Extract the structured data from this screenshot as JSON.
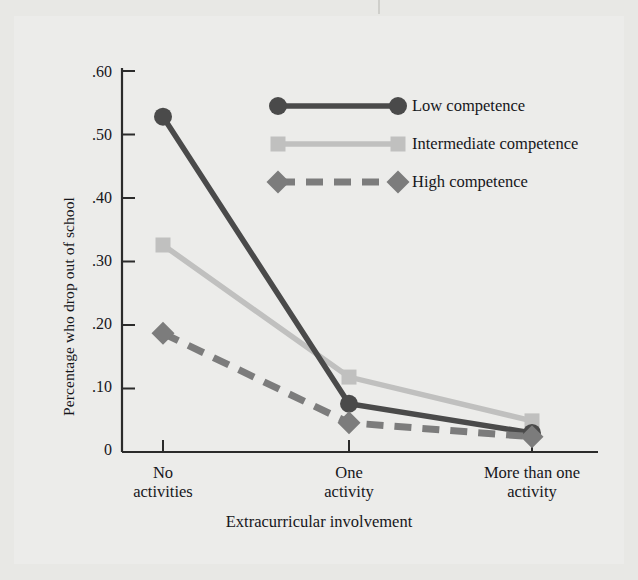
{
  "chart_data": {
    "type": "line",
    "title": "",
    "xlabel": "Extracurricular involvement",
    "ylabel": "Percentage who drop out of school",
    "categories": [
      "No\nactivities",
      "One\nactivity",
      "More than one\nactivity"
    ],
    "category_lines": [
      [
        "No",
        "activities"
      ],
      [
        "One",
        "activity"
      ],
      [
        "More than one",
        "activity"
      ]
    ],
    "ylim": [
      0,
      0.65
    ],
    "yticks": [
      0,
      0.1,
      0.2,
      0.3,
      0.4,
      0.5,
      0.6
    ],
    "ytick_labels": [
      "0",
      ".10",
      ".20",
      ".30",
      ".40",
      ".50",
      ".60"
    ],
    "grid": false,
    "legend_position": "upper-right-inside",
    "series": [
      {
        "name": "Low competence",
        "values": [
          0.528,
          0.076,
          0.03
        ],
        "color": "#4a4a4a",
        "marker": "circle",
        "line_style": "solid"
      },
      {
        "name": "Intermediate competence",
        "values": [
          0.326,
          0.118,
          0.049
        ],
        "color": "#c0c0bf",
        "marker": "square",
        "line_style": "solid"
      },
      {
        "name": "High competence",
        "values": [
          0.187,
          0.046,
          0.024
        ],
        "color": "#7c7c7c",
        "marker": "diamond",
        "line_style": "dashed"
      }
    ]
  },
  "legend": {
    "items": [
      {
        "label": "Low competence"
      },
      {
        "label": "Intermediate competence"
      },
      {
        "label": "High competence"
      }
    ]
  },
  "axes": {
    "y_title": "Percentage who drop out of school",
    "x_title": "Extracurricular involvement"
  }
}
